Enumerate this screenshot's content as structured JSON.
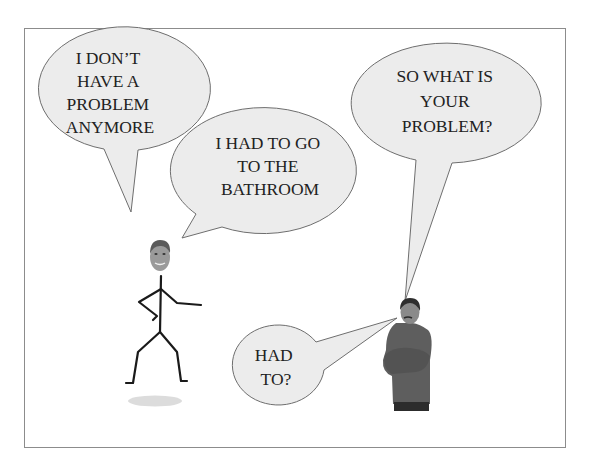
{
  "panel": {
    "border_color": "#8c8c8c",
    "background": "#ffffff"
  },
  "colors": {
    "bubble_fill": "#ececec",
    "bubble_stroke": "#6e6e6e",
    "text": "#222222",
    "stick": "#1a1a1a",
    "shadow": "#dcdcdc",
    "sweater": "#5a5a5a",
    "skin": "#8a8a8a"
  },
  "bubbles": [
    {
      "id": "bubble-no-problem",
      "speaker": "stick-figure",
      "lines": [
        "I DON’T",
        "HAVE A",
        "PROBLEM",
        "ANYMORE"
      ]
    },
    {
      "id": "bubble-bathroom",
      "speaker": "stick-figure",
      "lines": [
        "I HAD TO GO",
        "TO THE",
        "BATHROOM"
      ]
    },
    {
      "id": "bubble-what-problem",
      "speaker": "man",
      "lines": [
        "SO WHAT IS",
        "YOUR",
        "PROBLEM?"
      ]
    },
    {
      "id": "bubble-had-to",
      "speaker": "man",
      "lines": [
        "HAD",
        "TO?"
      ]
    }
  ],
  "characters": {
    "left": "stick-figure-with-photo-head",
    "right": "man-with-crossed-arms"
  }
}
